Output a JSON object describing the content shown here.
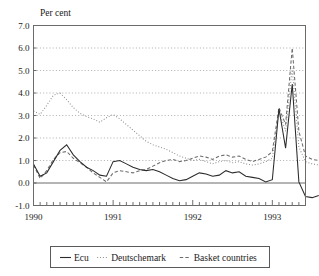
{
  "chart_data": {
    "type": "line",
    "title": "Per cent",
    "xlabel": "",
    "ylabel": "Per cent",
    "ylim": [
      -1.0,
      7.0
    ],
    "ytick_step": 1.0,
    "yticks": [
      "7.0",
      "6.0",
      "5.0",
      "4.0",
      "3.0",
      "2.0",
      "1.0",
      "0.0",
      "-1.0"
    ],
    "ytick_values": [
      7.0,
      6.0,
      5.0,
      4.0,
      3.0,
      2.0,
      1.0,
      0.0,
      -1.0
    ],
    "xticks": [
      "1990",
      "1991",
      "1992",
      "1993"
    ],
    "xtick_values": [
      0,
      12,
      24,
      36
    ],
    "x_minor_ticks_per_year": 12,
    "x_range": [
      0,
      41
    ],
    "grid": "horizontal-dotted",
    "zero_line": true,
    "legend_position": "below-plot",
    "series": [
      {
        "name": "Ecu",
        "style": "solid",
        "color": "#2b2b2b",
        "values": [
          0.85,
          0.3,
          0.45,
          0.95,
          1.45,
          1.7,
          1.25,
          0.95,
          0.7,
          0.55,
          0.35,
          0.3,
          0.95,
          1.0,
          0.85,
          0.7,
          0.6,
          0.55,
          0.6,
          0.5,
          0.35,
          0.2,
          0.1,
          0.15,
          0.3,
          0.45,
          0.4,
          0.3,
          0.35,
          0.55,
          0.45,
          0.5,
          0.3,
          0.25,
          0.2,
          0.05,
          0.15,
          3.3,
          1.55,
          4.4,
          0.05,
          -0.6,
          -0.65,
          -0.55
        ],
        "peak_value": 4.4,
        "min_value": -0.65
      },
      {
        "name": "Deutschemark",
        "style": "dotted",
        "color": "#8e8e8e",
        "values": [
          3.2,
          3.05,
          3.45,
          3.9,
          4.0,
          3.7,
          3.35,
          3.1,
          2.95,
          2.85,
          2.7,
          2.9,
          3.05,
          2.85,
          2.6,
          2.35,
          2.1,
          1.85,
          1.7,
          1.6,
          1.5,
          1.35,
          1.2,
          1.1,
          1.0,
          1.05,
          0.95,
          0.85,
          0.95,
          1.0,
          0.9,
          0.95,
          0.85,
          0.8,
          0.85,
          0.95,
          1.1,
          3.2,
          2.3,
          5.1,
          1.6,
          0.95,
          0.85,
          0.8
        ],
        "peak_value": 5.1,
        "min_value": 0.8
      },
      {
        "name": "Basket countries",
        "style": "dashed",
        "color": "#6d6d6d",
        "values": [
          0.8,
          0.2,
          0.55,
          1.05,
          1.35,
          1.4,
          1.1,
          0.9,
          0.7,
          0.45,
          0.25,
          0.05,
          0.45,
          0.55,
          0.5,
          0.45,
          0.55,
          0.6,
          0.75,
          0.9,
          1.0,
          1.05,
          0.95,
          1.0,
          1.1,
          1.2,
          1.15,
          1.05,
          1.2,
          1.25,
          1.15,
          1.2,
          1.05,
          0.95,
          1.05,
          1.15,
          1.4,
          3.35,
          2.6,
          6.0,
          2.3,
          1.2,
          1.05,
          1.0
        ],
        "peak_value": 6.0,
        "min_value": 0.05
      }
    ],
    "legend_entries": [
      {
        "label": "Ecu",
        "style": "solid"
      },
      {
        "label": "Deutschemark",
        "style": "dotted"
      },
      {
        "label": "Basket countries",
        "style": "dashed"
      }
    ]
  }
}
